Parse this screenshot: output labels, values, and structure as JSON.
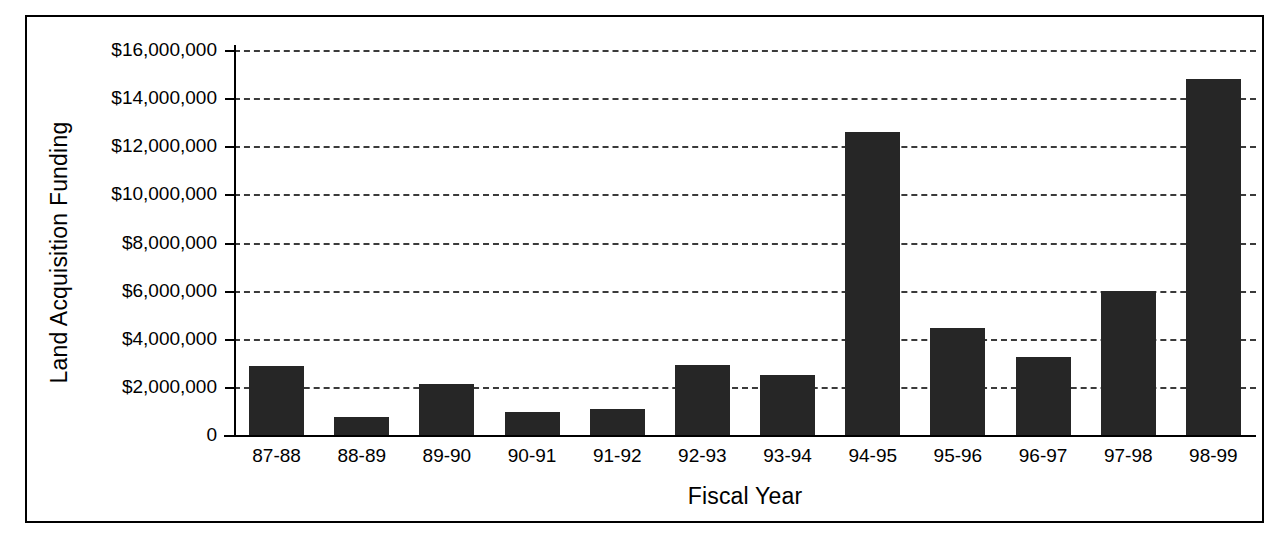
{
  "chart_data": {
    "type": "bar",
    "title": "",
    "xlabel": "Fiscal Year",
    "ylabel": "Land Acquisition Funding",
    "categories": [
      "87-88",
      "88-89",
      "89-90",
      "90-91",
      "91-92",
      "92-93",
      "93-94",
      "94-95",
      "95-96",
      "96-97",
      "97-98",
      "98-99"
    ],
    "values": [
      2850000,
      750000,
      2100000,
      950000,
      1100000,
      2900000,
      2500000,
      12600000,
      4450000,
      3250000,
      6000000,
      14800000
    ],
    "ylim": [
      0,
      16000000
    ],
    "ytick_values": [
      0,
      2000000,
      4000000,
      6000000,
      8000000,
      10000000,
      12000000,
      14000000,
      16000000
    ],
    "ytick_labels": [
      "0",
      "$2,000,000",
      "$4,000,000",
      "$6,000,000",
      "$8,000,000",
      "$10,000,000",
      "$12,000,000",
      "$14,000,000",
      "$16,000,000"
    ],
    "grid": true,
    "grid_style": "dashed-horizontal",
    "legend": false,
    "bar_color": "#262626",
    "axis_color": "#000000",
    "background_color": "#ffffff",
    "frame_border_color": "#000000"
  }
}
